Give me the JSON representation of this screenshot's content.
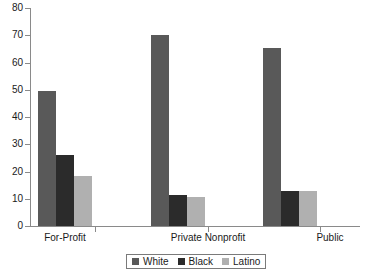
{
  "chart_data": {
    "type": "bar",
    "title": "",
    "xlabel": "",
    "ylabel": "",
    "ylim": [
      0,
      80
    ],
    "yticks": [
      0,
      10,
      20,
      30,
      40,
      50,
      60,
      70,
      80
    ],
    "grid": false,
    "legend_position": "bottom",
    "categories": [
      "For-Profit",
      "Private Nonprofit",
      "Public"
    ],
    "series": [
      {
        "name": "White",
        "color": "#595959",
        "values": [
          49.5,
          70.0,
          65.5
        ]
      },
      {
        "name": "Black",
        "color": "#2b2b2b",
        "values": [
          26.0,
          11.5,
          13.0
        ]
      },
      {
        "name": "Latino",
        "color": "#b0b0b0",
        "values": [
          18.5,
          10.8,
          13.0
        ]
      }
    ]
  },
  "legend": {
    "items": [
      {
        "label": "White",
        "color": "#595959"
      },
      {
        "label": "Black",
        "color": "#2b2b2b"
      },
      {
        "label": "Latino",
        "color": "#b0b0b0"
      }
    ]
  },
  "axes": {
    "y_tick_labels": [
      "0",
      "10",
      "20",
      "30",
      "40",
      "50",
      "60",
      "70",
      "80"
    ],
    "x_tick_labels": [
      "For-Profit",
      "Private Nonprofit",
      "Public"
    ]
  },
  "colors": {
    "axis": "#8a8a8a",
    "text": "#1a1a1a",
    "background": "#ffffff"
  }
}
